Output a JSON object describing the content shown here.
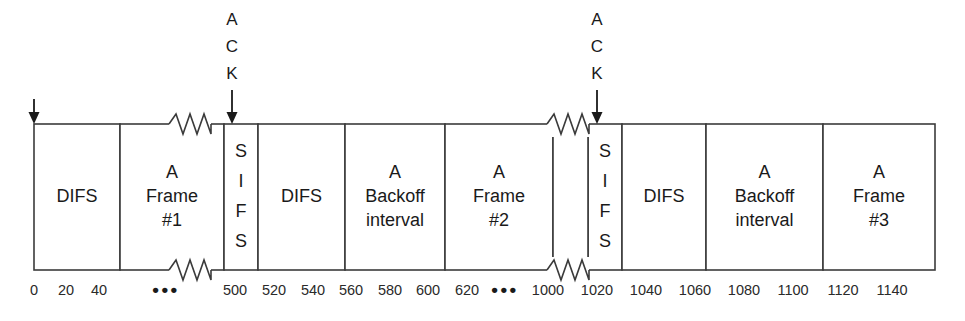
{
  "figure": {
    "kind": "ieee-802-11-csma-ca-timing-diagram",
    "background_color": "#ffffff",
    "line_color": "#3b3b3b",
    "text_color": "#1a1a1a"
  },
  "chart_data": {
    "type": "timeline",
    "title": "",
    "xlabel": "",
    "ylabel": "",
    "xlim": [
      0,
      1150
    ],
    "grid": false,
    "legend": null,
    "axis_tick_labels": [
      "0",
      "20",
      "40",
      "•••",
      "500",
      "520",
      "540",
      "560",
      "580",
      "600",
      "620",
      "•••",
      "1000",
      "1020",
      "1040",
      "1060",
      "1080",
      "1100",
      "1120",
      "1140"
    ],
    "segments": [
      {
        "label": "DIFS",
        "lines": [
          "DIFS"
        ],
        "orientation": "horizontal"
      },
      {
        "label": "A Frame #1",
        "lines": [
          "A",
          "Frame",
          "#1"
        ],
        "orientation": "horizontal"
      },
      {
        "label": "SIFS",
        "lines": [
          "S",
          "I",
          "F",
          "S"
        ],
        "orientation": "vertical"
      },
      {
        "label": "DIFS",
        "lines": [
          "DIFS"
        ],
        "orientation": "horizontal"
      },
      {
        "label": "A Backoff interval",
        "lines": [
          "A",
          "Backoff",
          "interval"
        ],
        "orientation": "horizontal"
      },
      {
        "label": "A Frame #2",
        "lines": [
          "A",
          "Frame",
          "#2"
        ],
        "orientation": "horizontal"
      },
      {
        "label": "SIFS",
        "lines": [
          "S",
          "I",
          "F",
          "S"
        ],
        "orientation": "vertical"
      },
      {
        "label": "DIFS",
        "lines": [
          "DIFS"
        ],
        "orientation": "horizontal"
      },
      {
        "label": "A Backoff interval",
        "lines": [
          "A",
          "Backoff",
          "interval"
        ],
        "orientation": "horizontal"
      },
      {
        "label": "A Frame #3",
        "lines": [
          "A",
          "Frame",
          "#3"
        ],
        "orientation": "horizontal"
      }
    ],
    "annotations": [
      {
        "name": "start-arrow",
        "label": "",
        "x": 34
      },
      {
        "name": "ack-annotation-1",
        "label": "ACK",
        "lines": [
          "A",
          "C",
          "K"
        ],
        "x": 232
      },
      {
        "name": "ack-annotation-2",
        "label": "ACK",
        "lines": [
          "A",
          "C",
          "K"
        ],
        "x": 597
      }
    ],
    "break_marks": [
      {
        "name": "axis-break-1",
        "x": 190
      },
      {
        "name": "axis-break-2",
        "x": 568
      }
    ]
  },
  "boxes": [
    {
      "id": "difs-1",
      "x": 34,
      "w": 86,
      "lines": [
        "DIFS"
      ],
      "vertical": false
    },
    {
      "id": "frame-1",
      "x": 120,
      "w": 104,
      "lines": [
        "A",
        "Frame",
        "#1"
      ],
      "vertical": false
    },
    {
      "id": "sifs-1",
      "x": 224,
      "w": 34,
      "lines": [
        "S",
        "I",
        "F",
        "S"
      ],
      "vertical": true
    },
    {
      "id": "difs-2",
      "x": 258,
      "w": 87,
      "lines": [
        "DIFS"
      ],
      "vertical": false
    },
    {
      "id": "backoff-1",
      "x": 345,
      "w": 100,
      "lines": [
        "A",
        "Backoff",
        "interval"
      ],
      "vertical": false
    },
    {
      "id": "frame-2",
      "x": 445,
      "w": 108,
      "lines": [
        "A",
        "Frame",
        "#2"
      ],
      "vertical": false
    },
    {
      "id": "sifs-2",
      "x": 588,
      "w": 34,
      "lines": [
        "S",
        "I",
        "F",
        "S"
      ],
      "vertical": true
    },
    {
      "id": "difs-3",
      "x": 622,
      "w": 84,
      "lines": [
        "DIFS"
      ],
      "vertical": false
    },
    {
      "id": "backoff-2",
      "x": 706,
      "w": 117,
      "lines": [
        "A",
        "Backoff",
        "interval"
      ],
      "vertical": false
    },
    {
      "id": "frame-3",
      "x": 823,
      "w": 112,
      "lines": [
        "A",
        "Frame",
        "#3"
      ],
      "vertical": false
    }
  ],
  "stub_boxes": [
    {
      "id": "frame-1-tail",
      "x": 553,
      "w": 35
    }
  ],
  "ticks": [
    {
      "label": "0",
      "x": 34
    },
    {
      "label": "20",
      "x": 66
    },
    {
      "label": "40",
      "x": 99
    },
    {
      "label": "•••",
      "x": 166,
      "dots": true
    },
    {
      "label": "500",
      "x": 235
    },
    {
      "label": "520",
      "x": 274
    },
    {
      "label": "540",
      "x": 313
    },
    {
      "label": "560",
      "x": 351
    },
    {
      "label": "580",
      "x": 390
    },
    {
      "label": "600",
      "x": 428
    },
    {
      "label": "620",
      "x": 467
    },
    {
      "label": "•••",
      "x": 505,
      "dots": true
    },
    {
      "label": "1000",
      "x": 548
    },
    {
      "label": "1020",
      "x": 597
    },
    {
      "label": "1040",
      "x": 646
    },
    {
      "label": "1060",
      "x": 695
    },
    {
      "label": "1080",
      "x": 744
    },
    {
      "label": "1100",
      "x": 793
    },
    {
      "label": "1120",
      "x": 843
    },
    {
      "label": "1140",
      "x": 892
    }
  ]
}
